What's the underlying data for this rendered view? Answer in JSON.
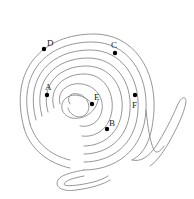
{
  "diagram": {
    "type": "spiral-maze",
    "line_color": "#8a8a8a",
    "dot_color": "#000000",
    "label_color": "#222222",
    "points": [
      {
        "id": "A",
        "label": "A",
        "x": 47,
        "y": 95,
        "lx": 45,
        "ly": 90
      },
      {
        "id": "B",
        "label": "B",
        "x": 107,
        "y": 129,
        "lx": 109,
        "ly": 126
      },
      {
        "id": "C",
        "label": "C",
        "x": 115,
        "y": 53,
        "lx": 111,
        "ly": 48
      },
      {
        "id": "D",
        "label": "D",
        "x": 44,
        "y": 49,
        "lx": 47,
        "ly": 46
      },
      {
        "id": "E",
        "label": "E",
        "x": 92,
        "y": 104,
        "lx": 94,
        "ly": 100
      },
      {
        "id": "F",
        "label": "F",
        "x": 135,
        "y": 95,
        "lx": 132,
        "ly": 108
      }
    ]
  }
}
